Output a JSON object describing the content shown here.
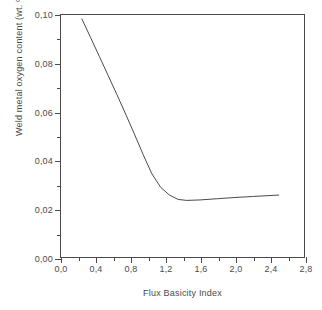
{
  "chart_data": {
    "type": "line",
    "title": "",
    "xlabel": "Flux Basicity Index",
    "ylabel": "Weld metal oxygen content (wt. %)",
    "xlim": [
      0.0,
      2.8
    ],
    "ylim": [
      0.0,
      0.1
    ],
    "grid": false,
    "legend": null,
    "x_major_ticks": [
      "0,0",
      "0,4",
      "0,8",
      "1,2",
      "1,6",
      "2,0",
      "2,4",
      "2,8"
    ],
    "x_major_values": [
      0.0,
      0.4,
      0.8,
      1.2,
      1.6,
      2.0,
      2.4,
      2.8
    ],
    "x_minor_values": [
      0.2,
      0.6,
      1.0,
      1.4,
      1.8,
      2.2,
      2.6
    ],
    "y_major_ticks": [
      "0,00",
      "0,02",
      "0,04",
      "0,06",
      "0,08",
      "0,10"
    ],
    "y_major_values": [
      0.0,
      0.02,
      0.04,
      0.06,
      0.08,
      0.1
    ],
    "y_minor_values": [
      0.01,
      0.03,
      0.05,
      0.07,
      0.09
    ],
    "line_color": "#4a4a4a",
    "line_width": 1,
    "series": [
      {
        "name": "Weld metal oxygen content",
        "x": [
          0.25,
          0.35,
          0.45,
          0.55,
          0.65,
          0.75,
          0.85,
          0.95,
          1.05,
          1.15,
          1.25,
          1.35,
          1.45,
          1.6,
          1.8,
          2.0,
          2.2,
          2.4,
          2.5
        ],
        "y": [
          0.098,
          0.0903,
          0.0826,
          0.0748,
          0.067,
          0.059,
          0.0508,
          0.0424,
          0.0345,
          0.029,
          0.0258,
          0.024,
          0.0236,
          0.0238,
          0.0243,
          0.0248,
          0.0252,
          0.0256,
          0.0258
        ]
      }
    ]
  }
}
